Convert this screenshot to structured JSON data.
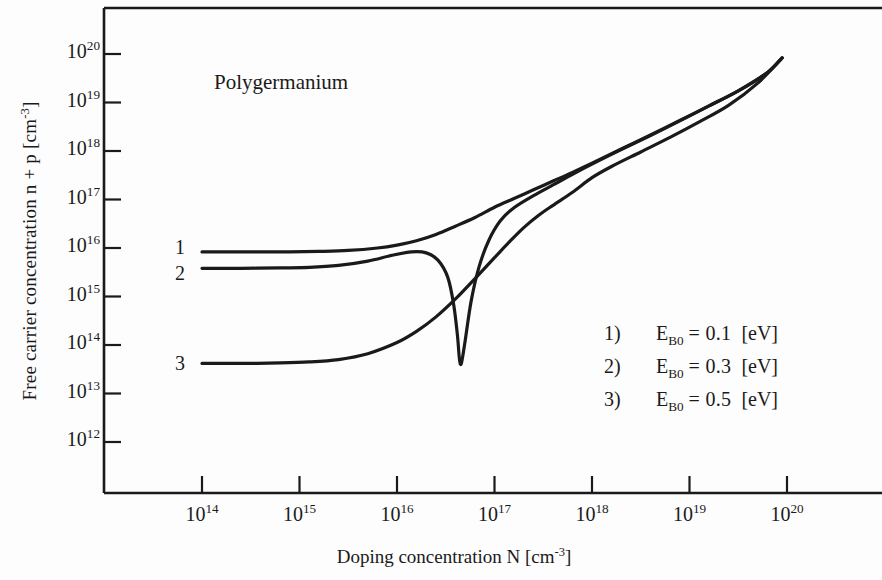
{
  "figure": {
    "plot_title": "Polygermanium",
    "curve_labels": [
      "1",
      "2",
      "3"
    ],
    "legend": [
      {
        "num": "1)",
        "symbol": "E",
        "sub": "B0",
        "value": "= 0.1",
        "unit": "[eV]"
      },
      {
        "num": "2)",
        "symbol": "E",
        "sub": "B0",
        "value": "= 0.3",
        "unit": "[eV]"
      },
      {
        "num": "3)",
        "symbol": "E",
        "sub": "B0",
        "value": "= 0.5",
        "unit": "[eV]"
      }
    ]
  },
  "chart_data": {
    "type": "line",
    "title": "Polygermanium",
    "xlabel": "Doping concentration N  [cm",
    "xlabel_sup": "-3",
    "xlabel_tail": "]",
    "ylabel": "Free carrier concentration  n + p  [cm",
    "ylabel_sup": "-3",
    "ylabel_tail": "]",
    "xscale": "log",
    "yscale": "log",
    "xlim": [
      13.4,
      20.45
    ],
    "ylim": [
      11.55,
      20.6
    ],
    "xticks": [
      14,
      15,
      16,
      17,
      18,
      19,
      20
    ],
    "yticks": [
      12,
      13,
      14,
      15,
      16,
      17,
      18,
      19,
      20
    ],
    "xtick_labels": [
      "10",
      "10",
      "10",
      "10",
      "10",
      "10",
      "10"
    ],
    "xtick_exponents": [
      "14",
      "15",
      "16",
      "17",
      "18",
      "19",
      "20"
    ],
    "ytick_labels": [
      "10",
      "10",
      "10",
      "10",
      "10",
      "10",
      "10",
      "10",
      "10"
    ],
    "ytick_exponents": [
      "20",
      "19",
      "18",
      "17",
      "16",
      "15",
      "14",
      "13",
      "12"
    ],
    "grid": false,
    "legend_position": "lower-right",
    "series": [
      {
        "name": "1) E_B0 = 0.1 eV",
        "label": "1",
        "points": [
          [
            14.0,
            15.92
          ],
          [
            14.3,
            15.92
          ],
          [
            14.6,
            15.92
          ],
          [
            14.9,
            15.92
          ],
          [
            15.2,
            15.93
          ],
          [
            15.5,
            15.95
          ],
          [
            15.8,
            16.0
          ],
          [
            16.0,
            16.06
          ],
          [
            16.2,
            16.15
          ],
          [
            16.4,
            16.28
          ],
          [
            16.6,
            16.45
          ],
          [
            16.8,
            16.63
          ],
          [
            17.0,
            16.84
          ],
          [
            17.2,
            17.02
          ],
          [
            17.4,
            17.2
          ],
          [
            17.6,
            17.38
          ],
          [
            17.8,
            17.56
          ],
          [
            18.0,
            17.75
          ],
          [
            18.3,
            18.04
          ],
          [
            18.6,
            18.33
          ],
          [
            18.9,
            18.63
          ],
          [
            19.2,
            18.93
          ],
          [
            19.5,
            19.24
          ],
          [
            19.8,
            19.62
          ],
          [
            19.95,
            19.92
          ]
        ]
      },
      {
        "name": "2) E_B0 = 0.3 eV",
        "label": "2",
        "points": [
          [
            14.0,
            15.58
          ],
          [
            14.4,
            15.58
          ],
          [
            14.8,
            15.59
          ],
          [
            15.1,
            15.6
          ],
          [
            15.4,
            15.64
          ],
          [
            15.7,
            15.73
          ],
          [
            15.95,
            15.85
          ],
          [
            16.15,
            15.92
          ],
          [
            16.3,
            15.9
          ],
          [
            16.42,
            15.75
          ],
          [
            16.52,
            15.4
          ],
          [
            16.58,
            14.85
          ],
          [
            16.62,
            14.2
          ],
          [
            16.64,
            13.72
          ],
          [
            16.66,
            13.62
          ],
          [
            16.7,
            14.1
          ],
          [
            16.76,
            14.9
          ],
          [
            16.84,
            15.6
          ],
          [
            16.94,
            16.15
          ],
          [
            17.06,
            16.56
          ],
          [
            17.2,
            16.83
          ],
          [
            17.4,
            17.08
          ],
          [
            17.6,
            17.3
          ],
          [
            17.8,
            17.52
          ],
          [
            18.0,
            17.73
          ],
          [
            18.3,
            18.03
          ],
          [
            18.6,
            18.32
          ],
          [
            18.9,
            18.62
          ],
          [
            19.2,
            18.93
          ],
          [
            19.5,
            19.24
          ],
          [
            19.8,
            19.62
          ],
          [
            19.95,
            19.92
          ]
        ]
      },
      {
        "name": "3) E_B0 = 0.5 eV",
        "label": "3",
        "points": [
          [
            14.0,
            13.62
          ],
          [
            14.4,
            13.62
          ],
          [
            14.8,
            13.63
          ],
          [
            15.1,
            13.65
          ],
          [
            15.4,
            13.7
          ],
          [
            15.7,
            13.82
          ],
          [
            16.0,
            14.05
          ],
          [
            16.2,
            14.28
          ],
          [
            16.4,
            14.58
          ],
          [
            16.6,
            14.95
          ],
          [
            16.8,
            15.37
          ],
          [
            17.0,
            15.8
          ],
          [
            17.15,
            16.12
          ],
          [
            17.3,
            16.42
          ],
          [
            17.45,
            16.67
          ],
          [
            17.6,
            16.88
          ],
          [
            17.8,
            17.15
          ],
          [
            18.0,
            17.45
          ],
          [
            18.2,
            17.68
          ],
          [
            18.5,
            17.98
          ],
          [
            18.8,
            18.28
          ],
          [
            19.1,
            18.6
          ],
          [
            19.4,
            18.94
          ],
          [
            19.7,
            19.4
          ],
          [
            19.95,
            19.92
          ]
        ]
      }
    ]
  }
}
